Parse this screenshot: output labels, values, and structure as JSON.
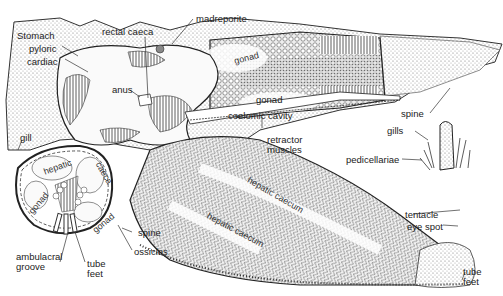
{
  "diagram": {
    "views": [
      {
        "name": "dissected-dorsal-view",
        "description": "Central disc and arms opened from above"
      },
      {
        "name": "arm-cross-section",
        "description": "Transverse section of an arm"
      },
      {
        "name": "spine-detail",
        "description": "Detail of a spine with gills and pedicellariae"
      }
    ],
    "labels": {
      "stomach": "Stomach",
      "pyloric": "pyloric",
      "cardiac": "cardiac",
      "rectal_caeca": "rectal caeca",
      "madreporite": "madreporite",
      "anus": "anus",
      "gonad_upper": "gonad",
      "gonad_middle": "gonad",
      "coelomic_cavity": "coelomic cavity",
      "retractor_muscles_1": "retractor",
      "retractor_muscles_2": "muscles",
      "gill": "gill",
      "spine_main": "spine",
      "gills": "gills",
      "pedicellariae": "pedicellariae",
      "hepatic_caecum_1": "hepatic caecum",
      "hepatic_caecum_2": "hepatic caecum",
      "tentacle": "tentacle",
      "eye_spot": "eye spot",
      "tube_feet_arm_1": "tube",
      "tube_feet_arm_2": "feet",
      "cs_hepatic": "hepatic",
      "cs_caeca": "caeca",
      "cs_gonad_left": "gonad",
      "cs_gonad_right": "gonad",
      "cs_spine": "spine",
      "cs_ossicles": "ossicles",
      "ambulacral_groove_1": "ambulacral",
      "ambulacral_groove_2": "groove",
      "cs_tube_feet_1": "tube",
      "cs_tube_feet_2": "feet"
    },
    "colors": {
      "ink": "#222222",
      "stipple": "#6a6a6a",
      "background": "#ffffff"
    }
  }
}
